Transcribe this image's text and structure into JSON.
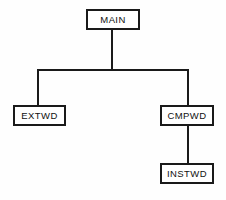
{
  "diagram": {
    "type": "hierarchy-tree",
    "orientation": "top-down",
    "colors": {
      "line": "#1a1a1a",
      "box_border": "#1a1a1a",
      "box_fill": "#ffffff",
      "background": "#fefefe",
      "text": "#111111"
    },
    "nodes": [
      {
        "id": "main",
        "label": "MAIN",
        "level": 0,
        "x": 86,
        "y": 9,
        "w": 54,
        "h": 21
      },
      {
        "id": "extwd",
        "label": "EXTWD",
        "level": 1,
        "x": 13,
        "y": 105,
        "w": 53,
        "h": 21
      },
      {
        "id": "cmpwd",
        "label": "CMPWD",
        "level": 1,
        "x": 160,
        "y": 105,
        "w": 54,
        "h": 21
      },
      {
        "id": "instwd",
        "label": "INSTWD",
        "level": 2,
        "x": 160,
        "y": 163,
        "w": 54,
        "h": 21
      }
    ],
    "edges": [
      {
        "from": "main",
        "to": "extwd",
        "style": "orthogonal"
      },
      {
        "from": "main",
        "to": "cmpwd",
        "style": "orthogonal"
      },
      {
        "from": "cmpwd",
        "to": "instwd",
        "style": "straight"
      }
    ]
  }
}
